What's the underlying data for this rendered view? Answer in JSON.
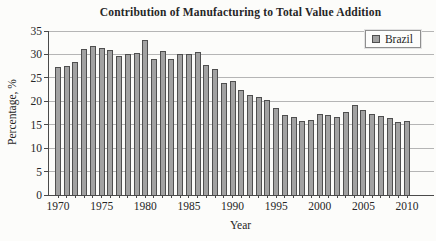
{
  "figure": {
    "background": "#fcfcfa"
  },
  "chart_data": {
    "type": "bar",
    "title": "Contribution of Manufacturing to Total Value Addition",
    "xlabel": "Year",
    "ylabel": "Percentage, %",
    "ylim": [
      0,
      35
    ],
    "yticks": [
      0,
      5,
      10,
      15,
      20,
      25,
      30,
      35
    ],
    "xtick_labels": [
      "1970",
      "1975",
      "1980",
      "1985",
      "1990",
      "1995",
      "2000",
      "2005",
      "2010"
    ],
    "grid": true,
    "legend_position": "top-right",
    "categories": [
      1970,
      1971,
      1972,
      1973,
      1974,
      1975,
      1976,
      1977,
      1978,
      1979,
      1980,
      1981,
      1982,
      1983,
      1984,
      1985,
      1986,
      1987,
      1988,
      1989,
      1990,
      1991,
      1992,
      1993,
      1994,
      1995,
      1996,
      1997,
      1998,
      1999,
      2000,
      2001,
      2002,
      2003,
      2004,
      2005,
      2006,
      2007,
      2008,
      2009,
      2010
    ],
    "series": [
      {
        "name": "Brazil",
        "values": [
          27.3,
          27.5,
          28.3,
          31.2,
          31.8,
          31.4,
          31.0,
          29.6,
          30.2,
          30.4,
          33.1,
          29.1,
          30.8,
          29.0,
          30.2,
          30.0,
          30.5,
          27.7,
          27.0,
          23.8,
          24.4,
          22.5,
          21.4,
          20.9,
          20.2,
          18.6,
          17.1,
          16.7,
          15.7,
          16.1,
          17.3,
          17.1,
          16.7,
          17.8,
          19.3,
          18.1,
          17.3,
          16.9,
          16.5,
          15.6,
          15.8
        ]
      }
    ],
    "colors": {
      "bar_fill": "#a2a2a2",
      "bar_border": "#4f4f4f",
      "grid": "#b5b5b5",
      "axis": "#4a4a4a",
      "text": "#262626"
    }
  }
}
